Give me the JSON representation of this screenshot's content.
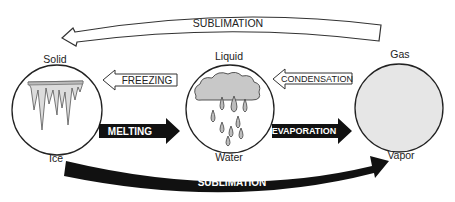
{
  "states": [
    {
      "id": "solid",
      "top_label": "Solid",
      "bottom_label": "Ice",
      "fill": "#ffffff",
      "illustration": "icicles-icon"
    },
    {
      "id": "liquid",
      "top_label": "Liquid",
      "bottom_label": "Water",
      "fill": "#ffffff",
      "illustration": "rain-cloud-icon"
    },
    {
      "id": "gas",
      "top_label": "Gas",
      "bottom_label": "Vapor",
      "fill": "#e6e6e6",
      "illustration": "none"
    }
  ],
  "transitions": {
    "top_sublimation": {
      "label": "SUBLIMATION",
      "from": "Gas",
      "to": "Solid",
      "style": "outline"
    },
    "freezing": {
      "label": "FREEZING",
      "from": "Liquid",
      "to": "Solid",
      "style": "outline"
    },
    "melting": {
      "label": "MELTING",
      "from": "Solid",
      "to": "Liquid",
      "style": "filled"
    },
    "condensation": {
      "label": "CONDENSATION",
      "from": "Gas",
      "to": "Liquid",
      "style": "outline"
    },
    "evaporation": {
      "label": "EVAPORATION",
      "from": "Liquid",
      "to": "Gas",
      "style": "filled"
    },
    "bottom_sublimation": {
      "label": "SUBLIMATION",
      "from": "Solid",
      "to": "Gas",
      "style": "filled"
    }
  },
  "colors": {
    "stroke": "#222222",
    "filled_arrow": "#111111",
    "gas_fill": "#e6e6e6",
    "ice_fill": "#dcdcdc",
    "cloud_fill": "#c8c8c8",
    "drop_fill": "#bdbdbd"
  }
}
